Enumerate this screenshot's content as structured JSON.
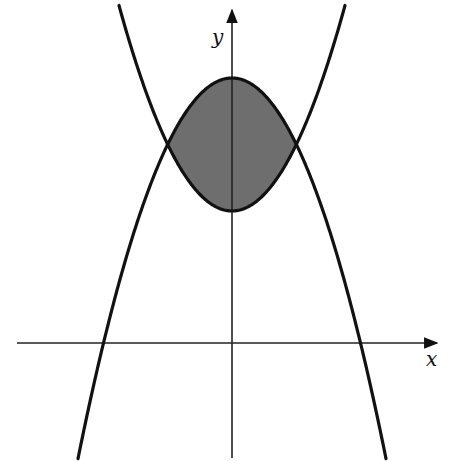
{
  "figure": {
    "colors": {
      "background": "#ffffff",
      "curve": "#111111",
      "axis": "#222222",
      "shaded_region": "#6e6e6e"
    },
    "axes": {
      "x_label": "x",
      "y_label": "y",
      "origin_px": [
        232,
        343
      ]
    },
    "curves": [
      {
        "name": "downward-parabola",
        "vertex_px": [
          232,
          78
        ],
        "x_intercepts_px": [
          104,
          361
        ],
        "opens": "down"
      },
      {
        "name": "upward-parabola",
        "vertex_px": [
          232,
          211
        ],
        "opens": "up"
      }
    ],
    "intersections_px": [
      [
        167,
        143
      ],
      [
        297,
        143
      ]
    ],
    "shaded_region": "area between the two parabolas, bounded by their intersection points"
  }
}
